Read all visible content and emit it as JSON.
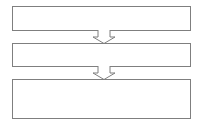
{
  "diagram": {
    "type": "flowchart",
    "orientation": "vertical",
    "canvas": {
      "width": 206,
      "height": 131
    },
    "background_color": "#ffffff",
    "stroke_color": "#7f7f7f",
    "fill_color": "#ffffff",
    "nodes": [
      {
        "id": "node-1",
        "label": "",
        "shape": "rectangle",
        "x": 12,
        "y": 6,
        "width": 179,
        "height": 25
      },
      {
        "id": "node-2",
        "label": "",
        "shape": "rectangle",
        "x": 12,
        "y": 43,
        "width": 179,
        "height": 24
      },
      {
        "id": "node-3",
        "label": "",
        "shape": "rectangle",
        "x": 12,
        "y": 79,
        "width": 179,
        "height": 40
      }
    ],
    "connectors": [
      {
        "id": "arrow-1",
        "from": "node-1",
        "to": "node-2",
        "style": "block-arrow",
        "direction": "down",
        "label": "",
        "x": 92,
        "y": 30,
        "width": 24,
        "height": 14
      },
      {
        "id": "arrow-2",
        "from": "node-2",
        "to": "node-3",
        "style": "block-arrow",
        "direction": "down",
        "label": "",
        "x": 92,
        "y": 66,
        "width": 24,
        "height": 14
      }
    ]
  }
}
